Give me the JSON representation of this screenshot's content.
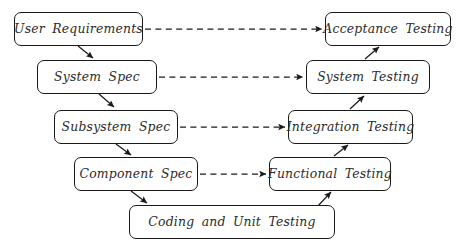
{
  "diagram": {
    "type": "v-model-flow-diagram",
    "background_color": "#ffffff",
    "line_color": "#1a1a1a",
    "text_color": "#2b2b2b",
    "nodes": [
      {
        "id": "user-requirements",
        "label": "User Requirements",
        "side": "left",
        "level": 1,
        "x": 14,
        "y": 12,
        "w": 129,
        "h": 34
      },
      {
        "id": "acceptance-testing",
        "label": "Acceptance Testing",
        "side": "right",
        "level": 1,
        "x": 325,
        "y": 12,
        "w": 126,
        "h": 34
      },
      {
        "id": "system-spec",
        "label": "System Spec",
        "side": "left",
        "level": 2,
        "x": 37,
        "y": 60,
        "w": 120,
        "h": 34
      },
      {
        "id": "system-testing",
        "label": "System Testing",
        "side": "right",
        "level": 2,
        "x": 306,
        "y": 60,
        "w": 124,
        "h": 34
      },
      {
        "id": "subsystem-spec",
        "label": "Subsystem Spec",
        "side": "left",
        "level": 3,
        "x": 54,
        "y": 110,
        "w": 124,
        "h": 34
      },
      {
        "id": "integration-testing",
        "label": "Integration Testing",
        "side": "right",
        "level": 3,
        "x": 288,
        "y": 110,
        "w": 125,
        "h": 34
      },
      {
        "id": "component-spec",
        "label": "Component Spec",
        "side": "left",
        "level": 4,
        "x": 74,
        "y": 157,
        "w": 124,
        "h": 34
      },
      {
        "id": "functional-testing",
        "label": "Functional Testing",
        "side": "right",
        "level": 4,
        "x": 269,
        "y": 157,
        "w": 122,
        "h": 34
      },
      {
        "id": "coding-unit-testing",
        "label": "Coding and Unit Testing",
        "side": "bottom",
        "level": 5,
        "x": 129,
        "y": 205,
        "w": 206,
        "h": 34
      }
    ],
    "dashed_links": [
      {
        "from": "user-requirements",
        "to": "acceptance-testing",
        "style": "dashed",
        "direction": "right"
      },
      {
        "from": "system-spec",
        "to": "system-testing",
        "style": "dashed",
        "direction": "right"
      },
      {
        "from": "subsystem-spec",
        "to": "integration-testing",
        "style": "dashed",
        "direction": "right"
      },
      {
        "from": "component-spec",
        "to": "functional-testing",
        "style": "dashed",
        "direction": "right"
      }
    ],
    "solid_links": [
      {
        "from": "user-requirements",
        "to": "system-spec",
        "style": "solid",
        "direction": "down-right"
      },
      {
        "from": "system-spec",
        "to": "subsystem-spec",
        "style": "solid",
        "direction": "down-right"
      },
      {
        "from": "subsystem-spec",
        "to": "component-spec",
        "style": "solid",
        "direction": "down-right"
      },
      {
        "from": "component-spec",
        "to": "coding-unit-testing",
        "style": "solid",
        "direction": "down-right"
      },
      {
        "from": "coding-unit-testing",
        "to": "functional-testing",
        "style": "solid",
        "direction": "up-right"
      },
      {
        "from": "functional-testing",
        "to": "integration-testing",
        "style": "solid",
        "direction": "up-right"
      },
      {
        "from": "integration-testing",
        "to": "system-testing",
        "style": "solid",
        "direction": "up-right"
      },
      {
        "from": "system-testing",
        "to": "acceptance-testing",
        "style": "solid",
        "direction": "up-right"
      }
    ]
  }
}
